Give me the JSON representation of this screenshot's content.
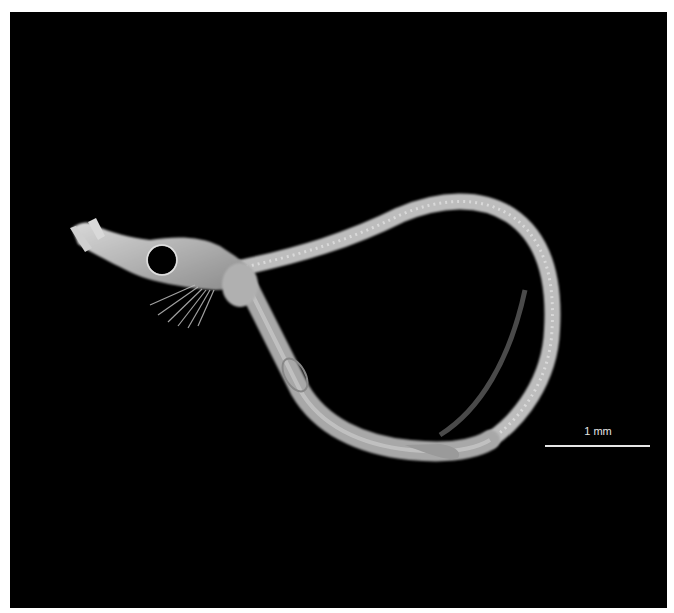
{
  "image": {
    "subject": "larval fish specimen, lateral view, cleared and photographed on black background",
    "background_color": "#000000",
    "border_color": "#ffffff"
  },
  "scale_bar": {
    "label": "1 mm",
    "color": "#e6e6e6"
  }
}
